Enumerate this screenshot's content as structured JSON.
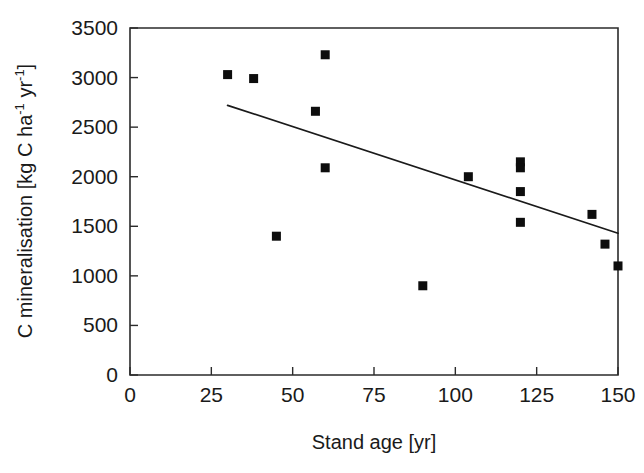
{
  "chart_data": {
    "type": "scatter",
    "title": "",
    "xlabel": "Stand age [yr]",
    "ylabel": "C mineralisation [kg C ha-1 yr-1]",
    "ylabel_parts": {
      "prefix": "C mineralisation [kg C ha",
      "sup1": "-1",
      "middle": " yr",
      "sup2": "-1",
      "suffix": "]"
    },
    "xlim": [
      0,
      150
    ],
    "ylim": [
      0,
      3500
    ],
    "xticks": [
      0,
      25,
      50,
      75,
      100,
      125,
      150
    ],
    "yticks": [
      0,
      500,
      1000,
      1500,
      2000,
      2500,
      3000,
      3500
    ],
    "xtick_labels": [
      "0",
      "25",
      "50",
      "75",
      "100",
      "125",
      "150"
    ],
    "ytick_labels": [
      "0",
      "500",
      "1000",
      "1500",
      "2000",
      "2500",
      "3000",
      "3500"
    ],
    "grid": false,
    "legend": false,
    "marker_style": "filled-square",
    "marker_color": "#0d0d0d",
    "points": [
      {
        "x": 30,
        "y": 3030
      },
      {
        "x": 38,
        "y": 2990
      },
      {
        "x": 45,
        "y": 1400
      },
      {
        "x": 57,
        "y": 2660
      },
      {
        "x": 60,
        "y": 3230
      },
      {
        "x": 60,
        "y": 2090
      },
      {
        "x": 90,
        "y": 900
      },
      {
        "x": 104,
        "y": 2000
      },
      {
        "x": 120,
        "y": 2150
      },
      {
        "x": 120,
        "y": 2090
      },
      {
        "x": 120,
        "y": 1850
      },
      {
        "x": 120,
        "y": 1540
      },
      {
        "x": 142,
        "y": 1620
      },
      {
        "x": 146,
        "y": 1320
      },
      {
        "x": 150,
        "y": 1100
      }
    ],
    "trendline": {
      "type": "linear-fit",
      "x_start": 30,
      "y_start": 2720,
      "x_end": 150,
      "y_end": 1430,
      "color": "#1a1a1a"
    }
  }
}
